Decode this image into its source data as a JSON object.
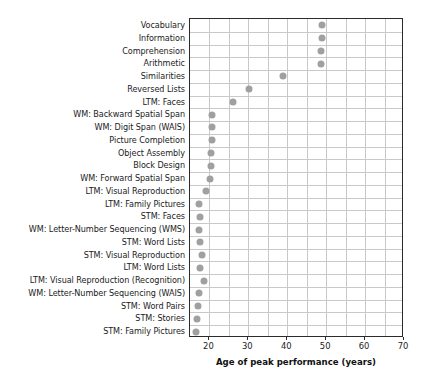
{
  "chart_data": {
    "type": "scatter",
    "title": "",
    "xlabel": "Age of peak performance (years)",
    "ylabel": "",
    "xlim": [
      15,
      70
    ],
    "ylim": [
      0,
      24
    ],
    "grid": true,
    "legend": null,
    "xticks": [
      20,
      30,
      40,
      50,
      60,
      70
    ],
    "xtick_labels": [
      "20",
      "30",
      "40",
      "50",
      "60",
      "70"
    ],
    "x_minor_step": 5,
    "orientation": "horizontal",
    "marker": {
      "shape": "circle",
      "color": "#a0a0a0",
      "size": 7
    },
    "categories": [
      "Vocabulary",
      "Information",
      "Comprehension",
      "Arithmetic",
      "Similarities",
      "Reversed Lists",
      "LTM: Faces",
      "WM: Backward Spatial Span",
      "WM: Digit Span (WAIS)",
      "Picture Completion",
      "Object Assembly",
      "Block Design",
      "WM: Forward Spatial Span",
      "LTM: Visual Reproduction",
      "LTM: Family Pictures",
      "STM: Faces",
      "WM: Letter-Number Sequencing (WMS)",
      "STM: Word Lists",
      "STM: Visual Reproduction",
      "LTM: Word Lists",
      "LTM: Visual Reproduction (Recognition)",
      "WM: Letter-Number Sequencing (WAIS)",
      "STM: Word Pairs",
      "STM: Stories",
      "STM: Family Pictures"
    ],
    "values": [
      49.0,
      48.8,
      48.6,
      48.6,
      38.8,
      30.2,
      26.1,
      20.7,
      20.6,
      20.6,
      20.4,
      20.4,
      20.1,
      19.0,
      17.2,
      17.6,
      17.4,
      17.6,
      18.2,
      17.6,
      18.6,
      17.2,
      17.0,
      16.8,
      16.6
    ]
  },
  "axis": {
    "x_title": "Age of peak performance (years)"
  }
}
